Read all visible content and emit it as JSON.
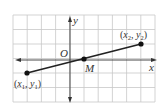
{
  "diagram": {
    "type": "coordinate-plane-midpoint",
    "grid": {
      "cols": 10,
      "rows": 6,
      "left": 13,
      "top": 15,
      "cell": 14.2,
      "cell_h": 14.5,
      "line_color": "#c8c8c8",
      "border_color": "#d0d0d0"
    },
    "origin_px": {
      "x": 70,
      "y": 60
    },
    "axes": {
      "x_label": "x",
      "y_label": "y",
      "origin_label": "O",
      "color": "#333333"
    },
    "segment": {
      "color": "#222222",
      "p1": {
        "grid": [
          -3,
          -1
        ],
        "label": "(x1, y1)"
      },
      "p2": {
        "grid": [
          5,
          1
        ],
        "label": "(x2, y2)"
      },
      "midpoint": {
        "grid": [
          1,
          0
        ],
        "label": "M"
      }
    },
    "labels": {
      "p1_text": "x",
      "p1_sub": "1",
      "p1_y": "y",
      "p1_ysub": "1",
      "p2_text": "x",
      "p2_sub": "2",
      "p2_y": "y",
      "p2_ysub": "2",
      "open_paren": "(",
      "close_paren": ")",
      "comma": ", ",
      "m": "M",
      "o": "O",
      "x_axis": "x",
      "y_axis": "y"
    }
  }
}
